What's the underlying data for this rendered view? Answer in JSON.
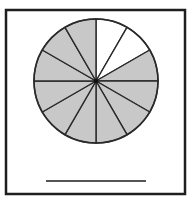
{
  "figure": {
    "total_parts": 12,
    "shaded_parts": 10,
    "unshaded_parts": 2,
    "unshaded_position": "top-right, from 12 o'clock to 2 o'clock",
    "colors": {
      "shade": "#c8c8c8",
      "unshaded": "#ffffff",
      "stroke": "#2a2a2a",
      "frame": "#1e1e1e",
      "answer_line": "#555555"
    }
  },
  "answer_line": {
    "text": ""
  }
}
